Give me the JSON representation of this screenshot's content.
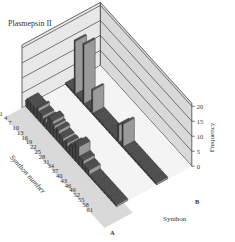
{
  "chart_data": {
    "type": "bar3d",
    "title": "Plasmepsin II",
    "xlabel": "Synthon number",
    "ylabel": "Synthon",
    "zlabel": "Frequency",
    "x_ticks": [
      "1",
      "4",
      "7",
      "10",
      "13",
      "16",
      "19",
      "22",
      "25",
      "28",
      "31",
      "34",
      "37",
      "40",
      "43",
      "46",
      "49",
      "52",
      "55",
      "58",
      "61"
    ],
    "y_ticks": [
      "A",
      "B"
    ],
    "z_ticks": [
      "0",
      "5",
      "10",
      "15",
      "20"
    ],
    "zlim": [
      0,
      20
    ],
    "categories": [
      1,
      2,
      3,
      4,
      5,
      6,
      7,
      8,
      9,
      10,
      11,
      12,
      13,
      14,
      15,
      16,
      17,
      18,
      19,
      20,
      21,
      22,
      23,
      24,
      25,
      26,
      27,
      28,
      29,
      30,
      31,
      32,
      33,
      34,
      35,
      36,
      37,
      38,
      39,
      40,
      41,
      42,
      43,
      44,
      45,
      46,
      47,
      48,
      49,
      50,
      51,
      52,
      53,
      54,
      55,
      56,
      57,
      58,
      59,
      60,
      61,
      62,
      63
    ],
    "series": [
      {
        "name": "A",
        "values": [
          2,
          3,
          3,
          3,
          3,
          3,
          3,
          3,
          4,
          3,
          3,
          3,
          2,
          3,
          2,
          4,
          5,
          5,
          5,
          4,
          3,
          4,
          4,
          3,
          3,
          3,
          2,
          3,
          3,
          2,
          3,
          4,
          4,
          5,
          6,
          6,
          6,
          3,
          3,
          3,
          2,
          2,
          2,
          2,
          0,
          0,
          0,
          0,
          0,
          0,
          0,
          0,
          0,
          0,
          0,
          0,
          0,
          0,
          0,
          0,
          0,
          0,
          0
        ]
      },
      {
        "name": "B",
        "values": [
          0,
          0,
          0,
          0,
          0,
          0,
          18,
          0,
          0,
          0,
          0,
          0,
          20,
          0,
          0,
          0,
          0,
          0,
          8,
          0,
          0,
          0,
          0,
          0,
          0,
          0,
          0,
          0,
          0,
          0,
          0,
          0,
          0,
          0,
          0,
          0,
          6,
          0,
          0,
          8,
          0,
          0,
          0,
          0,
          0,
          0,
          0,
          0,
          0,
          0,
          0,
          0,
          0,
          0,
          0,
          0,
          0,
          0,
          0,
          0,
          0,
          0,
          0
        ]
      }
    ]
  },
  "labels": {
    "title": "Plasmepsin II",
    "synthon_number": "Synthon number",
    "synthon": "Synthon",
    "frequency": "Frequency",
    "row_a": "A",
    "row_b": "B"
  }
}
